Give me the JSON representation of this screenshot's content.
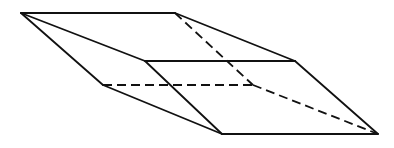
{
  "diagram": {
    "type": "line-drawing",
    "stroke_color": "#111111",
    "background": "#ffffff",
    "vertices": {
      "A": [
        21,
        13
      ],
      "B": [
        175,
        13
      ],
      "C": [
        145,
        61
      ],
      "D": [
        295,
        61
      ],
      "E": [
        103,
        85
      ],
      "F": [
        253,
        85
      ],
      "G": [
        222,
        134
      ],
      "H": [
        378,
        134
      ]
    },
    "edges": [
      {
        "from": "A",
        "to": "B",
        "style": "solid"
      },
      {
        "from": "A",
        "to": "C",
        "style": "solid"
      },
      {
        "from": "A",
        "to": "E",
        "style": "solid"
      },
      {
        "from": "B",
        "to": "D",
        "style": "solid"
      },
      {
        "from": "B",
        "to": "F",
        "style": "dashed"
      },
      {
        "from": "C",
        "to": "D",
        "style": "solid"
      },
      {
        "from": "C",
        "to": "G",
        "style": "solid"
      },
      {
        "from": "D",
        "to": "H",
        "style": "solid"
      },
      {
        "from": "E",
        "to": "F",
        "style": "dashed"
      },
      {
        "from": "E",
        "to": "G",
        "style": "solid"
      },
      {
        "from": "F",
        "to": "H",
        "style": "dashed"
      },
      {
        "from": "G",
        "to": "H",
        "style": "solid"
      }
    ]
  }
}
